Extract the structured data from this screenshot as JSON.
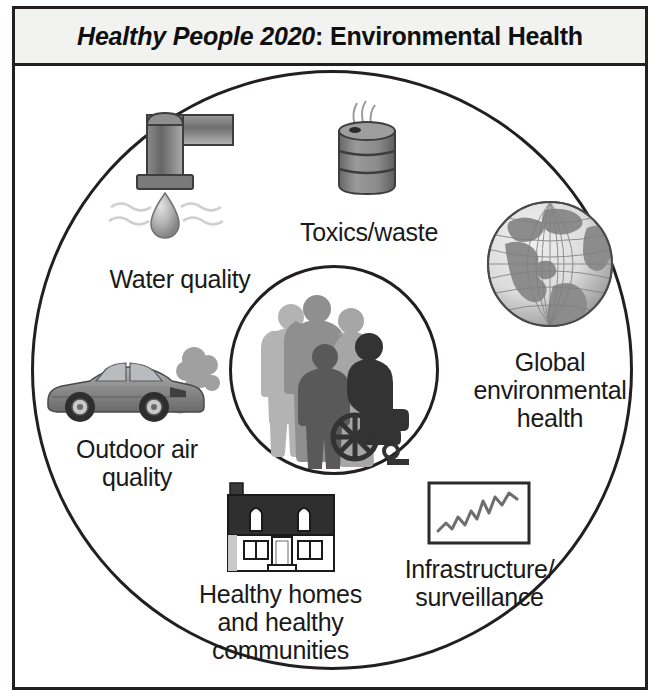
{
  "figure": {
    "title_emphasis": "Healthy People 2020",
    "title_rest": ": Environmental Health",
    "title_full": "Healthy People 2020: Environmental Health",
    "border_color": "#231f20",
    "title_bar_fill": "#f2f2f0"
  },
  "center": {
    "label": "",
    "icon": "people-group-silhouette-icon",
    "description": "silhouettes of a diverse group of people including an adult holding a child, a child, and a person using a wheelchair"
  },
  "nodes": [
    {
      "id": "water-quality",
      "label": "Water quality",
      "icon": "faucet-water-drop-icon",
      "icon_color": "#8c8c8c"
    },
    {
      "id": "toxics-waste",
      "label": "Toxics/waste",
      "icon": "waste-barrel-icon",
      "icon_color": "#8c8c8c"
    },
    {
      "id": "global-environmental-health",
      "label": "Global\nenvironmental\nhealth",
      "icon": "globe-icon",
      "icon_color": "#8c8c8c"
    },
    {
      "id": "outdoor-air-quality",
      "label": "Outdoor air\nquality",
      "icon": "car-exhaust-icon",
      "icon_color": "#8c8c8c"
    },
    {
      "id": "healthy-homes",
      "label": "Healthy homes\nand healthy\ncommunities",
      "icon": "house-icon",
      "icon_color": "#231f20"
    },
    {
      "id": "infrastructure-surveillance",
      "label": "Infrastructure/\nsurveillance",
      "icon": "line-chart-icon",
      "icon_color": "#6e6e6e"
    }
  ]
}
